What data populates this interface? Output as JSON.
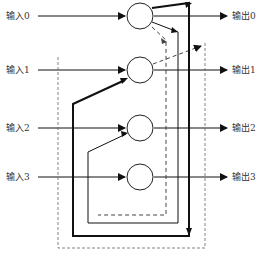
{
  "inputs": [
    {
      "label": "输入0",
      "y": 16
    },
    {
      "label": "输入1",
      "y": 70
    },
    {
      "label": "输入2",
      "y": 128
    },
    {
      "label": "输入3",
      "y": 177
    }
  ],
  "outputs": [
    {
      "label": "输出0",
      "y": 16
    },
    {
      "label": "输出1",
      "y": 70
    },
    {
      "label": "输出2",
      "y": 128
    },
    {
      "label": "输出3",
      "y": 177
    }
  ],
  "nodes": [
    {
      "cx": 140,
      "cy": 16
    },
    {
      "cx": 140,
      "cy": 70
    },
    {
      "cx": 140,
      "cy": 128
    },
    {
      "cx": 140,
      "cy": 177
    }
  ],
  "colors": {
    "line": "#111111",
    "dashed": "#444444",
    "text": "#333333"
  }
}
